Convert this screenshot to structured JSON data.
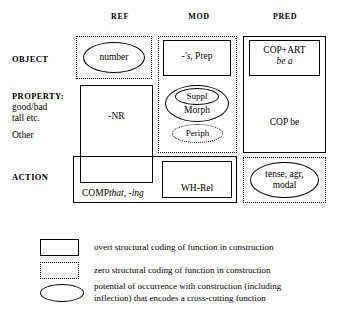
{
  "figure": {
    "type": "conceptual-space-grid",
    "columns": [
      {
        "id": "ref",
        "label": "REF"
      },
      {
        "id": "mod",
        "label": "MOD"
      },
      {
        "id": "pred",
        "label": "PRED"
      }
    ],
    "rows": [
      {
        "id": "object",
        "label": "OBJECT",
        "sublines": []
      },
      {
        "id": "property",
        "label": "PROPERTY:",
        "sublines": [
          "good/bad",
          "tall etc.",
          "Other"
        ]
      },
      {
        "id": "action",
        "label": "ACTION",
        "sublines": []
      }
    ],
    "cells": {
      "ref_object": {
        "coding": "zero",
        "shape": "oval",
        "text": "number"
      },
      "ref_property": {
        "coding": "overt",
        "shape": "box",
        "text": "-NR"
      },
      "ref_action": {
        "coding": "overt",
        "shape": "box",
        "text_plain": "COMP",
        "text_italic": "that, -ing"
      },
      "mod_group": {
        "coding": "zero",
        "shape": "box"
      },
      "mod_object": {
        "coding": "overt",
        "shape": "box",
        "text_italic": "-'s",
        "text_plain": ", Prep"
      },
      "mod_morph": {
        "coding": "oval",
        "text": "Morph"
      },
      "mod_suppl": {
        "coding": "oval",
        "text": "Suppl"
      },
      "mod_periph": {
        "coding": "zero-oval",
        "text": "Periph"
      },
      "mod_action": {
        "coding": "overt",
        "shape": "box",
        "text": "WH-Rel"
      },
      "pred_group": {
        "coding": "overt",
        "shape": "box"
      },
      "pred_object": {
        "coding": "overt",
        "shape": "box",
        "text_plain": "COP+ART",
        "text_italic": "be a"
      },
      "pred_property": {
        "coding": "overt",
        "text": "COP be"
      },
      "pred_action": {
        "coding": "zero",
        "shape": "box"
      },
      "pred_action_oval": {
        "coding": "oval",
        "line1": "tense, agr,",
        "line2": "modal"
      }
    }
  },
  "legend": {
    "items": [
      {
        "symbol": "solid-rectangle",
        "text": "overt structural coding of function in construction"
      },
      {
        "symbol": "dotted-rectangle",
        "text": "zero structural coding of function in construction"
      },
      {
        "symbol": "oval",
        "line1": "potential of occurrence with construction (including",
        "line2": "inflection) that encodes a cross-cutting function"
      }
    ]
  },
  "colors": {
    "ink": "#000000",
    "background": "#ffffff"
  }
}
